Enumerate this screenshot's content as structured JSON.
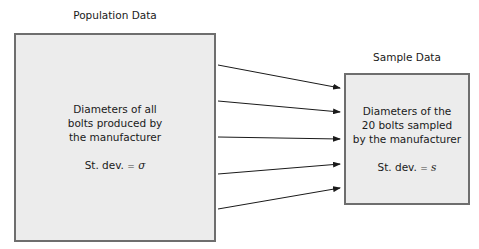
{
  "population": {
    "title": "Population Data",
    "lines": [
      "Diameters of all",
      "bolts produced by",
      "the manufacturer"
    ],
    "stat_prefix": "St. dev.",
    "stat_eq": "=",
    "stat_symbol": "σ"
  },
  "sample": {
    "title": "Sample Data",
    "lines": [
      "Diameters of the",
      "20 bolts sampled",
      "by the manufacturer"
    ],
    "stat_prefix": "St. dev.",
    "stat_eq": "=",
    "stat_symbol": "s"
  },
  "arrows": [
    {
      "x1": 218,
      "y1": 65,
      "x2": 340,
      "y2": 88
    },
    {
      "x1": 218,
      "y1": 101,
      "x2": 340,
      "y2": 112
    },
    {
      "x1": 218,
      "y1": 137,
      "x2": 340,
      "y2": 139
    },
    {
      "x1": 218,
      "y1": 174,
      "x2": 340,
      "y2": 164
    },
    {
      "x1": 218,
      "y1": 209,
      "x2": 340,
      "y2": 188
    }
  ],
  "colors": {
    "box_fill": "#ececec",
    "box_border": "#6e6e6e",
    "arrow": "#1a1a1a"
  }
}
